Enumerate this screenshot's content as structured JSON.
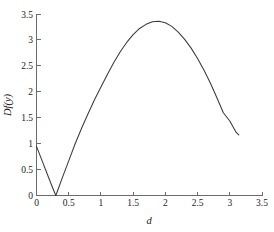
{
  "chart_data": {
    "type": "line",
    "title": "",
    "xlabel": "d",
    "ylabel": "Df(y)",
    "xlim": [
      0,
      3.5
    ],
    "ylim": [
      0,
      3.5
    ],
    "grid": false,
    "legend": false,
    "xticks": [
      "0",
      "0.5",
      "1",
      "1.5",
      "2",
      "2.5",
      "3",
      "3.5"
    ],
    "xtick_values": [
      0,
      0.5,
      1,
      1.5,
      2,
      2.5,
      3,
      3.5
    ],
    "yticks": [
      "0",
      "0.5",
      "1",
      "1.5",
      "2",
      "2.5",
      "3",
      "3.5"
    ],
    "ytick_values": [
      0,
      0.5,
      1,
      1.5,
      2,
      2.5,
      3,
      3.5
    ],
    "series": [
      {
        "name": "Df(y)",
        "color": "#3a3a3a",
        "x": [
          0.0,
          0.05,
          0.1,
          0.15,
          0.2,
          0.25,
          0.3,
          0.35,
          0.4,
          0.5,
          0.6,
          0.7,
          0.8,
          0.9,
          1.0,
          1.1,
          1.2,
          1.3,
          1.4,
          1.5,
          1.6,
          1.7,
          1.8,
          1.9,
          2.0,
          2.1,
          2.2,
          2.3,
          2.4,
          2.5,
          2.6,
          2.7,
          2.8,
          2.9,
          3.0,
          3.1,
          3.14
        ],
        "y": [
          0.95,
          0.79,
          0.63,
          0.47,
          0.31,
          0.15,
          0.0,
          0.17,
          0.34,
          0.67,
          1.0,
          1.3,
          1.58,
          1.85,
          2.1,
          2.34,
          2.57,
          2.78,
          2.96,
          3.11,
          3.23,
          3.31,
          3.36,
          3.37,
          3.34,
          3.27,
          3.16,
          3.02,
          2.85,
          2.65,
          2.42,
          2.17,
          1.89,
          1.6,
          1.44,
          1.22,
          1.17
        ]
      }
    ],
    "annotations": {
      "zero_crossing_d": 0.3,
      "peak_d": 1.9,
      "peak_value": 3.37,
      "start_value": 0.95,
      "end_d": 3.14,
      "end_value": 1.17
    },
    "colors": {
      "axis": "#6b6b6b",
      "curve": "#3a3a3a",
      "text": "#1a1a1a",
      "background": "#ffffff"
    }
  }
}
